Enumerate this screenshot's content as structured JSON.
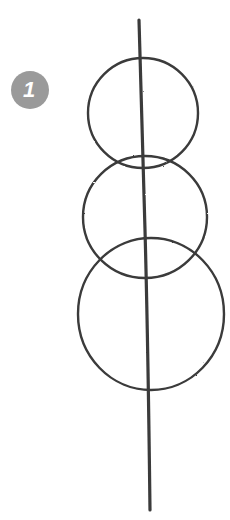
{
  "step": {
    "number": "1",
    "badge_color": "#9a9a9a"
  },
  "sketch": {
    "stroke_color": "#3a3a3a",
    "guideline": {
      "x1": 139,
      "y1": 20,
      "x2": 150,
      "y2": 510
    },
    "circles": [
      {
        "name": "top",
        "cx": 143,
        "cy": 113,
        "rx": 55,
        "ry": 55
      },
      {
        "name": "middle",
        "cx": 145,
        "cy": 217,
        "rx": 62,
        "ry": 61
      },
      {
        "name": "bottom",
        "cx": 151,
        "cy": 314,
        "rx": 73,
        "ry": 76
      }
    ]
  }
}
